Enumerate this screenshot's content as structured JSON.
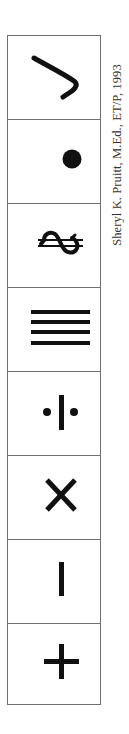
{
  "credit": {
    "text": "Sheryl K. Pruitt, M.Ed., ET/P, 1993"
  },
  "symbols": [
    {
      "name": "check-hook",
      "icon": "hook-stroke-icon"
    },
    {
      "name": "dot",
      "icon": "filled-dot-icon"
    },
    {
      "name": "sideways-dollar",
      "icon": "rotated-dollar-icon"
    },
    {
      "name": "four-lines",
      "icon": "four-horizontal-lines-icon"
    },
    {
      "name": "dot-bar-dot",
      "icon": "divide-bar-icon"
    },
    {
      "name": "times",
      "icon": "x-multiply-icon"
    },
    {
      "name": "vertical-bar",
      "icon": "vertical-bar-icon"
    },
    {
      "name": "plus",
      "icon": "plus-icon"
    }
  ],
  "colors": {
    "ink": "#111111",
    "border": "#6f6f6f",
    "background": "#ffffff",
    "text": "#333333"
  }
}
